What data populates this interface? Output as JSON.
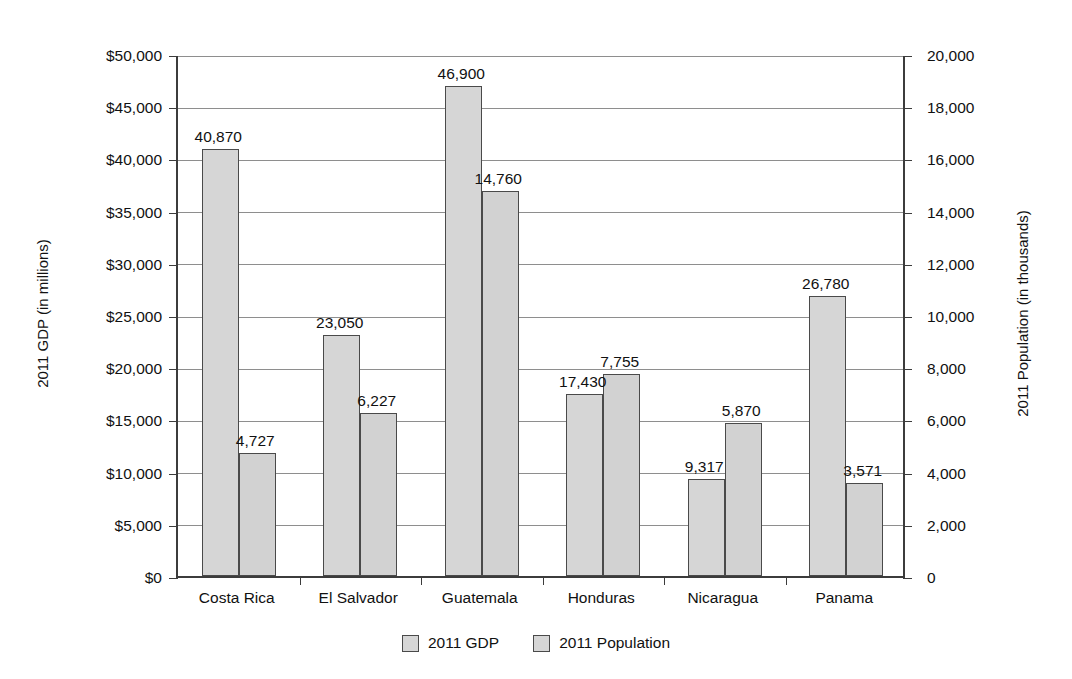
{
  "chart_data": {
    "type": "bar",
    "title": "",
    "subtitle": "",
    "categories": [
      "Costa Rica",
      "El Salvador",
      "Guatemala",
      "Honduras",
      "Nicaragua",
      "Panama"
    ],
    "series": [
      {
        "name": "2011 GDP",
        "axis": "left",
        "unit": "millions of dollars",
        "values": [
          40870,
          23050,
          46900,
          17430,
          9317,
          26780
        ],
        "labels": [
          "40,870",
          "23,050",
          "46,900",
          "17,430",
          "9,317",
          "26,780"
        ]
      },
      {
        "name": "2011 Population",
        "axis": "right",
        "unit": "thousands",
        "values": [
          4727,
          6227,
          14760,
          7755,
          5870,
          3571
        ],
        "labels": [
          "4,727",
          "6,227",
          "14,760",
          "7,755",
          "5,870",
          "3,571"
        ]
      }
    ],
    "left_axis": {
      "label": "2011 GDP (in millions)",
      "min": 0,
      "max": 50000,
      "step": 5000,
      "ticks": [
        "$0",
        "$5,000",
        "$10,000",
        "$15,000",
        "$20,000",
        "$25,000",
        "$30,000",
        "$35,000",
        "$40,000",
        "$45,000",
        "$50,000"
      ],
      "tick_values": [
        0,
        5000,
        10000,
        15000,
        20000,
        25000,
        30000,
        35000,
        40000,
        45000,
        50000
      ]
    },
    "right_axis": {
      "label": "2011 Population (in thousands)",
      "min": 0,
      "max": 20000,
      "step": 2000,
      "ticks": [
        "0",
        "2,000",
        "4,000",
        "6,000",
        "8,000",
        "10,000",
        "12,000",
        "14,000",
        "16,000",
        "18,000",
        "20,000"
      ],
      "tick_values": [
        0,
        2000,
        4000,
        6000,
        8000,
        10000,
        12000,
        14000,
        16000,
        18000,
        20000
      ]
    },
    "xlabel": "",
    "grid": true,
    "legend_position": "bottom",
    "legend": [
      "2011 GDP",
      "2011 Population"
    ],
    "colors": {
      "bar_fill": "#d6d6d6",
      "bar_border": "#4a4a4a",
      "gridline": "#8e8e8e",
      "axis": "#3c3c3c",
      "text": "#111111",
      "background": "#ffffff"
    }
  }
}
